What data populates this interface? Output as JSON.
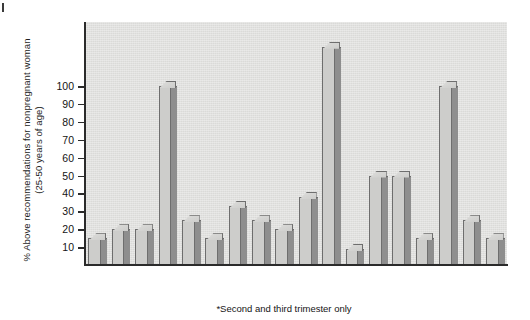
{
  "figure": {
    "corner_mark": "",
    "footnote": "*Second and third trimester only"
  },
  "chart_data": {
    "type": "bar",
    "title": "",
    "xlabel": "",
    "ylabel": "% Above recommendations for nonpregnant woman (25-50 years of age)",
    "ylabel_line1": "% Above recommendations for nonpregnant woman",
    "ylabel_line2": "(25-50 years of age)",
    "ylim": [
      0,
      135
    ],
    "yticks": [
      10,
      20,
      30,
      40,
      50,
      60,
      70,
      80,
      90,
      100
    ],
    "ytick_labels": [
      "10",
      "20",
      "30",
      "40",
      "50",
      "60",
      "70",
      "80",
      "90",
      "100"
    ],
    "grid": false,
    "legend": "none",
    "categories": [
      "*Energy",
      "Protein",
      "Vitamin A",
      "Vitamin D",
      "Vitamin E",
      "Vitamin C",
      "Thiamin",
      "Riboflavin",
      "Niacin",
      "Vitamin B-6",
      "Folate",
      "Vitamin B-12",
      "Calcium",
      "Phosphorus",
      "Magnesium",
      "Iron",
      "Zinc",
      "Iodide"
    ],
    "values": [
      15,
      20,
      20,
      100,
      25,
      15,
      33,
      25,
      20,
      38,
      122,
      9,
      50,
      50,
      15,
      100,
      25,
      15
    ],
    "annotation": "*Second and third trimester only",
    "colors": {
      "bar_face": "#cdcdcb",
      "bar_side": "#8e8e8e",
      "bar_edge": "#6e6e6e",
      "plot_background": "#e2e2e0",
      "axis": "#2b2b2b",
      "text": "#141414"
    }
  }
}
